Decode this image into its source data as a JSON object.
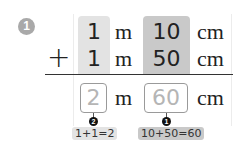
{
  "problem": {
    "number": "1",
    "row1": {
      "m_value": "1",
      "cm_value": "10"
    },
    "operator": "+",
    "row2": {
      "m_value": "1",
      "cm_value": "50"
    },
    "answer": {
      "m_value": "2",
      "cm_value": "60"
    },
    "units": {
      "m": "m",
      "cm": "cm"
    },
    "steps": [
      {
        "step": "2",
        "calculation": "1+1=2",
        "target": "m"
      },
      {
        "step": "1",
        "calculation": "10+50=60",
        "target": "cm"
      }
    ]
  },
  "colors": {
    "m_column": "#e3e3e3",
    "cm_column": "#c9c9c9",
    "answer_text": "#b5b5b5",
    "problem_badge": "#a9a9a9"
  }
}
